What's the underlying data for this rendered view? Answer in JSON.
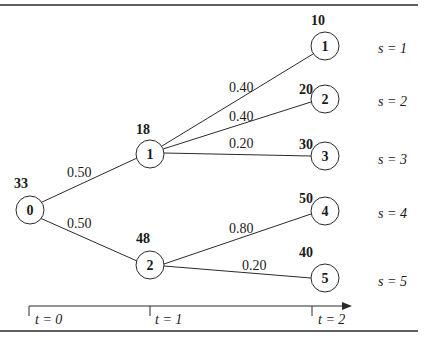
{
  "diagram": {
    "type": "scenario-tree",
    "colors": {
      "line": "#2a2a2a",
      "text": "#1a1a1a",
      "background": "#ffffff"
    },
    "root": {
      "id": "0",
      "label": "0",
      "value": "33"
    },
    "stage1": [
      {
        "id": "1",
        "label": "1",
        "value": "18",
        "prob_from_root": "0.50"
      },
      {
        "id": "2",
        "label": "2",
        "value": "48",
        "prob_from_root": "0.50"
      }
    ],
    "leaves": [
      {
        "id": "1",
        "label": "1",
        "value": "10",
        "parent": "1",
        "prob": "0.40",
        "scenario": "s = 1"
      },
      {
        "id": "2",
        "label": "2",
        "value": "20",
        "parent": "1",
        "prob": "0.40",
        "scenario": "s = 2"
      },
      {
        "id": "3",
        "label": "3",
        "value": "30",
        "parent": "1",
        "prob": "0.20",
        "scenario": "s = 3"
      },
      {
        "id": "4",
        "label": "4",
        "value": "50",
        "parent": "2",
        "prob": "0.80",
        "scenario": "s = 4"
      },
      {
        "id": "5",
        "label": "5",
        "value": "40",
        "parent": "2",
        "prob": "0.20",
        "scenario": "s = 5"
      }
    ],
    "time_axis": {
      "ticks": [
        "t = 0",
        "t = 1",
        "t = 2"
      ]
    }
  }
}
